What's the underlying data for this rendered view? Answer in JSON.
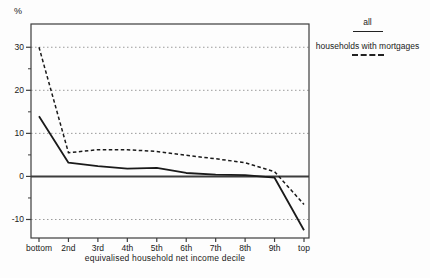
{
  "chart_data": {
    "type": "line",
    "title": "",
    "xlabel": "equivalised household net income decile",
    "ylabel": "%",
    "categories": [
      "bottom",
      "2nd",
      "3rd",
      "4th",
      "5th",
      "6th",
      "7th",
      "8th",
      "9th",
      "top"
    ],
    "series": [
      {
        "name": "all",
        "line_style": "solid",
        "values": [
          14,
          3.2,
          2.4,
          1.8,
          2.0,
          0.8,
          0.4,
          0.3,
          -0.3,
          -12.5
        ]
      },
      {
        "name": "households with mortgages",
        "line_style": "dashed",
        "values": [
          30,
          5.5,
          6.2,
          6.2,
          5.8,
          4.9,
          4.1,
          3.2,
          1.1,
          -6.5
        ]
      }
    ],
    "ylim": [
      -14.3,
      35.4
    ],
    "yticks": [
      -10,
      0,
      10,
      20,
      30
    ],
    "yticks_minor": [
      -5,
      5,
      15,
      25
    ],
    "grid": "horizontal dotted lines at major y ticks except zero; solid zero line across plot",
    "legend_position": "top-right outside plot",
    "colors": {
      "line": "#1a1a1a",
      "grid": "#9a9a9a",
      "axis": "#3d3d3d",
      "text": "#1a1a1a"
    }
  }
}
